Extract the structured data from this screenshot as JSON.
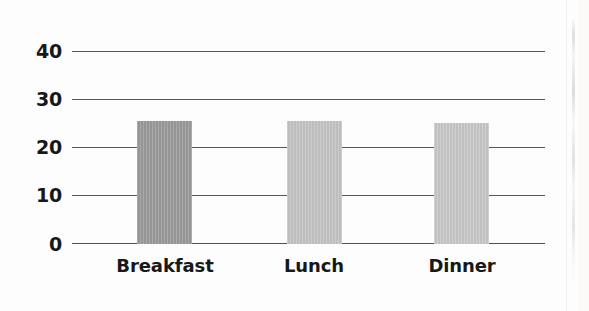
{
  "chart_data": {
    "type": "bar",
    "title": "",
    "subtitle": "",
    "xlabel": "",
    "ylabel": "",
    "categories": [
      "Breakfast",
      "Lunch",
      "Dinner"
    ],
    "values": [
      25.4,
      25.4,
      25.0
    ],
    "series": [
      {
        "name": "",
        "values": [
          25.4,
          25.4,
          25.0
        ]
      }
    ],
    "ylim": [
      0,
      40
    ],
    "yticks": [
      0,
      10,
      20,
      30,
      40
    ],
    "ytick_labels": [
      "0",
      "10",
      "20",
      "30",
      "40"
    ],
    "grid": true,
    "grid_axis": "y",
    "legend": false,
    "legend_position": "none",
    "bar_colors": [
      "#9a9a9a",
      "#c4c4c4",
      "#c8c8c8"
    ],
    "annotations": []
  },
  "axes": {
    "y": {
      "ticks": [
        {
          "label": "40",
          "value": 40
        },
        {
          "label": "30",
          "value": 30
        },
        {
          "label": "20",
          "value": 20
        },
        {
          "label": "10",
          "value": 10
        },
        {
          "label": "0",
          "value": 0
        }
      ]
    },
    "x": {
      "ticks": [
        {
          "label": "Breakfast"
        },
        {
          "label": "Lunch"
        },
        {
          "label": "Dinner"
        }
      ]
    }
  },
  "style": {
    "background": "#fdfdfd",
    "gridline_color": "#57585a",
    "axis_color": "#4e4f51",
    "text_color": "#17181a"
  }
}
